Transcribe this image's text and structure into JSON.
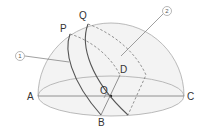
{
  "labels": {
    "A": "A",
    "B": "B",
    "C": "C",
    "D": "D",
    "O": "O",
    "P": "P",
    "Q": "Q",
    "circle1": "1",
    "circle2": "2"
  },
  "colors": {
    "dome_fill": "#f2f2f2",
    "outline": "#9a9a9a",
    "curve": "#555555",
    "text": "#333333"
  }
}
